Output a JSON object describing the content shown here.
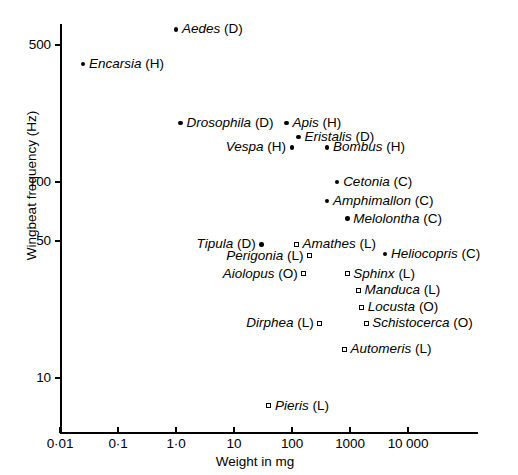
{
  "chart_data": {
    "type": "scatter",
    "title": "",
    "xlabel": "Weight in mg",
    "ylabel": "Wingbeat frequency (Hz)",
    "xscale": "log",
    "yscale": "log",
    "xlim": [
      0.01,
      50000
    ],
    "ylim": [
      6,
      700
    ],
    "grid": false,
    "legend": "none",
    "xticks": [
      {
        "value": 0.01,
        "label": "0·01"
      },
      {
        "value": 0.1,
        "label": "0·1"
      },
      {
        "value": 1.0,
        "label": "1·0"
      },
      {
        "value": 10,
        "label": "10"
      },
      {
        "value": 100,
        "label": "100"
      },
      {
        "value": 1000,
        "label": "1000"
      },
      {
        "value": 10000,
        "label": "10 000"
      }
    ],
    "yticks": [
      {
        "value": 500,
        "label": "500"
      },
      {
        "value": 100,
        "label": "100"
      },
      {
        "value": 50,
        "label": "50"
      },
      {
        "value": 10,
        "label": "10"
      }
    ],
    "marker_types": {
      "circle": "filled circle",
      "square": "open square"
    },
    "order_codes": {
      "D": "Diptera",
      "H": "Hymenoptera",
      "C": "Coleoptera",
      "L": "Lepidoptera",
      "O": "Orthoptera"
    },
    "points": [
      {
        "genus": "Aedes",
        "order": "D",
        "weight": 1.0,
        "frequency": 600,
        "marker": "circle",
        "label_side": "right"
      },
      {
        "genus": "Encarsia",
        "order": "H",
        "weight": 0.025,
        "frequency": 400,
        "marker": "circle",
        "label_side": "right"
      },
      {
        "genus": "Drosophila",
        "order": "D",
        "weight": 1.2,
        "frequency": 200,
        "marker": "circle",
        "label_side": "right"
      },
      {
        "genus": "Apis",
        "order": "H",
        "weight": 80,
        "frequency": 200,
        "marker": "circle",
        "label_side": "right"
      },
      {
        "genus": "Eristalis",
        "order": "D",
        "weight": 130,
        "frequency": 170,
        "marker": "circle",
        "label_side": "right"
      },
      {
        "genus": "Vespa",
        "order": "H",
        "weight": 100,
        "frequency": 150,
        "marker": "circle",
        "label_side": "left"
      },
      {
        "genus": "Bombus",
        "order": "H",
        "weight": 400,
        "frequency": 150,
        "marker": "circle",
        "label_side": "right"
      },
      {
        "genus": "Cetonia",
        "order": "C",
        "weight": 600,
        "frequency": 100,
        "marker": "circle",
        "label_side": "right"
      },
      {
        "genus": "Amphimallon",
        "order": "C",
        "weight": 400,
        "frequency": 80,
        "marker": "circle",
        "label_side": "right"
      },
      {
        "genus": "Melolontha",
        "order": "C",
        "weight": 900,
        "frequency": 65,
        "marker": "circle",
        "label_side": "right"
      },
      {
        "genus": "Tipula",
        "order": "D",
        "weight": 30,
        "frequency": 48,
        "marker": "circle",
        "label_side": "left"
      },
      {
        "genus": "Amathes",
        "order": "L",
        "weight": 120,
        "frequency": 48,
        "marker": "square",
        "label_side": "right"
      },
      {
        "genus": "Heliocopris",
        "order": "C",
        "weight": 4000,
        "frequency": 43,
        "marker": "circle",
        "label_side": "right"
      },
      {
        "genus": "Perigonia",
        "order": "L",
        "weight": 200,
        "frequency": 42,
        "marker": "square",
        "label_side": "left"
      },
      {
        "genus": "Aiolopus",
        "order": "O",
        "weight": 160,
        "frequency": 34,
        "marker": "square",
        "label_side": "left"
      },
      {
        "genus": "Sphinx",
        "order": "L",
        "weight": 900,
        "frequency": 34,
        "marker": "square",
        "label_side": "right"
      },
      {
        "genus": "Manduca",
        "order": "L",
        "weight": 1400,
        "frequency": 28,
        "marker": "square",
        "label_side": "right"
      },
      {
        "genus": "Locusta",
        "order": "O",
        "weight": 1600,
        "frequency": 23,
        "marker": "square",
        "label_side": "right"
      },
      {
        "genus": "Dirphea",
        "order": "L",
        "weight": 300,
        "frequency": 19,
        "marker": "square",
        "label_side": "left"
      },
      {
        "genus": "Schistocerca",
        "order": "O",
        "weight": 1900,
        "frequency": 19,
        "marker": "square",
        "label_side": "right"
      },
      {
        "genus": "Automeris",
        "order": "L",
        "weight": 800,
        "frequency": 14,
        "marker": "square",
        "label_side": "right"
      },
      {
        "genus": "Pieris",
        "order": "L",
        "weight": 40,
        "frequency": 7.2,
        "marker": "square",
        "label_side": "right"
      }
    ]
  }
}
